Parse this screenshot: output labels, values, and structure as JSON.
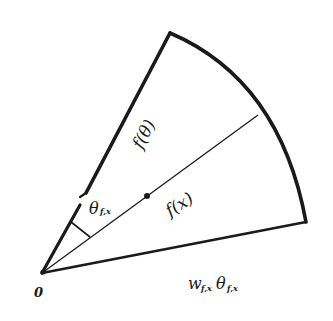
{
  "diagram": {
    "type": "circular-sector",
    "colors": {
      "ink": "#1a1a1a",
      "background": "#ffffff"
    },
    "labels": {
      "origin": "0",
      "upper_edge": "f(θ)",
      "bisector": "f(x)",
      "angle": "θ",
      "angle_sub": "f,x",
      "arc_w": "w",
      "arc_w_sub": "f,x",
      "arc_theta": "θ",
      "arc_theta_sub": "f,x"
    },
    "geometry": {
      "origin": [
        42,
        273
      ],
      "upper_corner": [
        170,
        33
      ],
      "lower_corner": [
        306,
        222
      ],
      "bisector_end": [
        258,
        115
      ],
      "midpoint_dot": [
        147,
        196
      ]
    }
  }
}
